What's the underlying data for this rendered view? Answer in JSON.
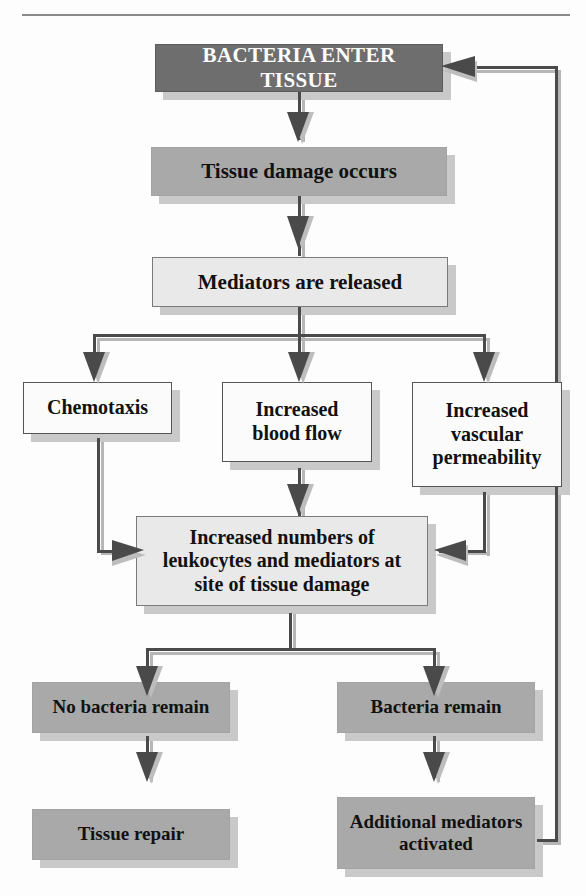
{
  "diagram": {
    "nodes": [
      {
        "id": "bacteria-enter-tissue",
        "label": "BACTERIA ENTER TISSUE",
        "style": "dark"
      },
      {
        "id": "tissue-damage-occurs",
        "label": "Tissue damage occurs",
        "style": "mid"
      },
      {
        "id": "mediators-are-released",
        "label": "Mediators are released",
        "style": "light"
      },
      {
        "id": "chemotaxis",
        "label": "Chemotaxis",
        "style": "white"
      },
      {
        "id": "increased-blood-flow",
        "label": "Increased\nblood flow",
        "style": "white"
      },
      {
        "id": "increased-vascular-permeability",
        "label": "Increased\nvascular\npermeability",
        "style": "white"
      },
      {
        "id": "increased-leukocytes",
        "label": "Increased numbers of\nleukocytes and mediators at\nsite of tissue damage",
        "style": "light"
      },
      {
        "id": "no-bacteria-remain",
        "label": "No bacteria remain",
        "style": "mid"
      },
      {
        "id": "bacteria-remain",
        "label": "Bacteria remain",
        "style": "mid"
      },
      {
        "id": "tissue-repair",
        "label": "Tissue repair",
        "style": "mid"
      },
      {
        "id": "additional-mediators-activated",
        "label": "Additional mediators\nactivated",
        "style": "mid"
      }
    ],
    "edges": [
      {
        "from": "bacteria-enter-tissue",
        "to": "tissue-damage-occurs"
      },
      {
        "from": "tissue-damage-occurs",
        "to": "mediators-are-released"
      },
      {
        "from": "mediators-are-released",
        "to": "chemotaxis"
      },
      {
        "from": "mediators-are-released",
        "to": "increased-blood-flow"
      },
      {
        "from": "mediators-are-released",
        "to": "increased-vascular-permeability"
      },
      {
        "from": "chemotaxis",
        "to": "increased-leukocytes"
      },
      {
        "from": "increased-blood-flow",
        "to": "increased-leukocytes"
      },
      {
        "from": "increased-vascular-permeability",
        "to": "increased-leukocytes"
      },
      {
        "from": "increased-leukocytes",
        "to": "no-bacteria-remain"
      },
      {
        "from": "increased-leukocytes",
        "to": "bacteria-remain"
      },
      {
        "from": "no-bacteria-remain",
        "to": "tissue-repair"
      },
      {
        "from": "bacteria-remain",
        "to": "additional-mediators-activated"
      },
      {
        "from": "additional-mediators-activated",
        "to": "bacteria-enter-tissue"
      }
    ],
    "colors": {
      "dark_box": "#6e6e6e",
      "mid_box": "#a9a9a9",
      "light_box": "#e9e9e9",
      "white_box": "#fbfbfb",
      "line": "#4a4a4a",
      "line_shadow": "#b6b6b6",
      "text_dark": "#111111",
      "text_light": "#ffffff",
      "page_background": "#fdfdfd"
    }
  }
}
